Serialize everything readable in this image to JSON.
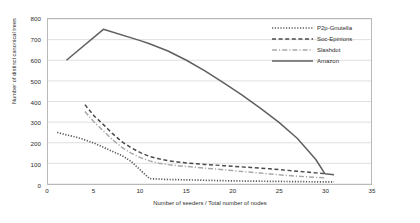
{
  "chart_data": {
    "type": "line",
    "title": "",
    "xlabel": "Number of seeders / Total number of nodes",
    "ylabel": "Number of distinct canonical trees",
    "xlim": [
      0,
      35
    ],
    "ylim": [
      0,
      800
    ],
    "xticks": [
      0,
      5,
      10,
      15,
      20,
      25,
      30,
      35
    ],
    "yticks": [
      0,
      100,
      200,
      300,
      400,
      500,
      600,
      700,
      800
    ],
    "grid": "horizontal",
    "legend_position": "top-right",
    "series": [
      {
        "name": "P2p-Gnutella",
        "style": "dotted",
        "color": "#595959",
        "points": [
          [
            1,
            250
          ],
          [
            2,
            238
          ],
          [
            3,
            228
          ],
          [
            4,
            214
          ],
          [
            5,
            198
          ],
          [
            6,
            178
          ],
          [
            7,
            158
          ],
          [
            8,
            138
          ],
          [
            9,
            110
          ],
          [
            10,
            68
          ],
          [
            11,
            26
          ],
          [
            12,
            24
          ],
          [
            13,
            22
          ],
          [
            14,
            21
          ],
          [
            15,
            20
          ],
          [
            16,
            19
          ],
          [
            17,
            18
          ],
          [
            18,
            17
          ],
          [
            19,
            16
          ],
          [
            20,
            15
          ],
          [
            22,
            14
          ],
          [
            24,
            13
          ],
          [
            26,
            12
          ],
          [
            28,
            11
          ],
          [
            30,
            10
          ],
          [
            31,
            10
          ]
        ]
      },
      {
        "name": "Soc-Epinions",
        "style": "dashed",
        "color": "#4a4a4a",
        "points": [
          [
            4,
            385
          ],
          [
            5,
            330
          ],
          [
            6,
            288
          ],
          [
            7,
            244
          ],
          [
            8,
            205
          ],
          [
            9,
            176
          ],
          [
            10,
            152
          ],
          [
            11,
            134
          ],
          [
            12,
            122
          ],
          [
            13,
            113
          ],
          [
            14,
            107
          ],
          [
            15,
            102
          ],
          [
            16,
            98
          ],
          [
            17,
            95
          ],
          [
            18,
            92
          ],
          [
            19,
            89
          ],
          [
            20,
            86
          ],
          [
            21,
            83
          ],
          [
            22,
            80
          ],
          [
            23,
            77
          ],
          [
            24,
            74
          ],
          [
            25,
            70
          ],
          [
            26,
            66
          ],
          [
            27,
            62
          ],
          [
            28,
            58
          ],
          [
            29,
            54
          ],
          [
            30,
            50
          ]
        ]
      },
      {
        "name": "Slashdot",
        "style": "dashdot",
        "color": "#a8a8a8",
        "points": [
          [
            4,
            352
          ],
          [
            5,
            300
          ],
          [
            6,
            258
          ],
          [
            7,
            214
          ],
          [
            8,
            178
          ],
          [
            9,
            150
          ],
          [
            10,
            128
          ],
          [
            11,
            112
          ],
          [
            12,
            101
          ],
          [
            13,
            94
          ],
          [
            14,
            89
          ],
          [
            15,
            85
          ],
          [
            16,
            81
          ],
          [
            17,
            77
          ],
          [
            18,
            73
          ],
          [
            19,
            69
          ],
          [
            20,
            65
          ],
          [
            21,
            61
          ],
          [
            22,
            57
          ],
          [
            23,
            53
          ],
          [
            24,
            49
          ],
          [
            25,
            45
          ],
          [
            26,
            41
          ],
          [
            27,
            38
          ],
          [
            28,
            35
          ],
          [
            29,
            32
          ],
          [
            30,
            30
          ]
        ]
      },
      {
        "name": "Amazon",
        "style": "solid",
        "color": "#606060",
        "points": [
          [
            2,
            600
          ],
          [
            6,
            750
          ],
          [
            10,
            695
          ],
          [
            11,
            680
          ],
          [
            13,
            645
          ],
          [
            15,
            600
          ],
          [
            17,
            548
          ],
          [
            19,
            492
          ],
          [
            21,
            432
          ],
          [
            23,
            368
          ],
          [
            25,
            300
          ],
          [
            27,
            222
          ],
          [
            29,
            120
          ],
          [
            30,
            50
          ],
          [
            31,
            45
          ]
        ]
      }
    ]
  },
  "legend": {
    "items": [
      {
        "label": "P2p-Gnutella"
      },
      {
        "label": "Soc-Epinions"
      },
      {
        "label": "Slashdot"
      },
      {
        "label": "Amazon"
      }
    ]
  }
}
